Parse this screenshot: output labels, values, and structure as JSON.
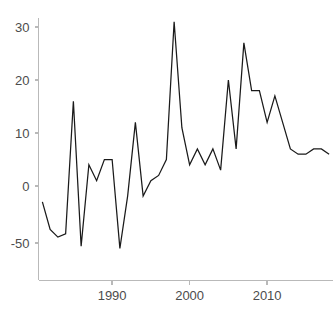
{
  "chart_data": {
    "type": "line",
    "title": "",
    "subtitle": "",
    "xlabel": "",
    "ylabel": "",
    "grid": false,
    "legend": false,
    "legend_position": "none",
    "line_color": "#1a1a1a",
    "axis_color": "#b9b9b9",
    "tick_label_color": "#4c4c4c",
    "background_color": "#ffffff",
    "y_axis_scale": "symlog",
    "y_tick_labels": [
      "30",
      "20",
      "10",
      "0",
      "-50"
    ],
    "y_tick_values": [
      30,
      20,
      10,
      0,
      -50
    ],
    "ylim": [
      -82,
      34
    ],
    "x_tick_labels": [
      "1990",
      "2000",
      "2010"
    ],
    "x_tick_values": [
      1990,
      2000,
      2010
    ],
    "xlim": [
      1980.5,
      2018.5
    ],
    "x": [
      1981,
      1982,
      1983,
      1984,
      1985,
      1986,
      1987,
      1988,
      1989,
      1990,
      1991,
      1992,
      1993,
      1994,
      1995,
      1996,
      1997,
      1998,
      1999,
      2000,
      2001,
      2002,
      2003,
      2004,
      2005,
      2006,
      2007,
      2008,
      2009,
      2010,
      2011,
      2012,
      2013,
      2014,
      2015,
      2016,
      2017,
      2018
    ],
    "values": [
      -2,
      -19,
      -33,
      -26,
      16,
      -63,
      4,
      1,
      5,
      5,
      -73,
      -1,
      12,
      -1,
      1,
      2,
      5,
      31,
      11,
      4,
      7,
      4,
      7,
      3,
      20,
      7,
      27,
      18,
      18,
      12,
      17,
      12,
      7,
      6,
      6,
      7,
      7,
      6
    ],
    "series": [
      {
        "name": "series-1",
        "values": [
          -2,
          -19,
          -33,
          -26,
          16,
          -63,
          4,
          1,
          5,
          5,
          -73,
          -1,
          12,
          -1,
          1,
          2,
          5,
          31,
          11,
          4,
          7,
          4,
          7,
          3,
          20,
          7,
          27,
          18,
          18,
          12,
          17,
          12,
          7,
          6,
          6,
          7,
          7,
          6
        ]
      }
    ],
    "annotations": []
  }
}
